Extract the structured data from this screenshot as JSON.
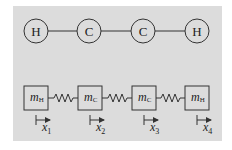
{
  "diagram": {
    "colors": {
      "panel_bg": "#dcdcdc",
      "stroke": "#333333",
      "page_bg": "#ffffff"
    },
    "molecule": {
      "atoms": [
        {
          "label": "H",
          "cx": 36
        },
        {
          "label": "C",
          "cx": 89
        },
        {
          "label": "C",
          "cx": 143
        },
        {
          "label": "H",
          "cx": 197
        }
      ],
      "bonds": "single"
    },
    "spring_model": {
      "masses": [
        {
          "symbol": "m",
          "subscript": "H",
          "x": 24
        },
        {
          "symbol": "m",
          "subscript": "C",
          "x": 78
        },
        {
          "symbol": "m",
          "subscript": "C",
          "x": 132
        },
        {
          "symbol": "m",
          "subscript": "H",
          "x": 185
        }
      ],
      "coordinates": [
        {
          "symbol": "x",
          "subscript": "1"
        },
        {
          "symbol": "x",
          "subscript": "2"
        },
        {
          "symbol": "x",
          "subscript": "3"
        },
        {
          "symbol": "x",
          "subscript": "4"
        }
      ]
    }
  }
}
